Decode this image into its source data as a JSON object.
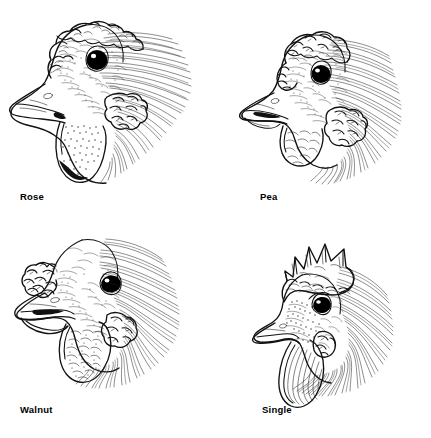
{
  "document": {
    "type": "line-art-illustration-plate",
    "subject": "Chicken comb types — head profiles",
    "background_color": "#ffffff",
    "ink_color": "#111111",
    "layout": "2x2 grid",
    "panel_count": 4
  },
  "panels": [
    {
      "id": "rose",
      "label": "Rose",
      "position": "top-left",
      "comb_type": "rose comb",
      "description": "Chicken head in left profile with a broad, bumpy rose comb rising over the crown, large round dark eye, pale beak, large pendulous wattle and textured earlobe, with hackle feathers streaming to the right.",
      "features": [
        "rose comb",
        "round eye",
        "beak",
        "wattle",
        "earlobe",
        "hackle feathers"
      ]
    },
    {
      "id": "pea",
      "label": "Pea",
      "position": "top-right",
      "comb_type": "pea comb",
      "description": "Chicken head in left profile with a low triple-ridged pea comb, round dark eye, open beak, small wattle and clustered earlobe, with long hackle feathers fanning down and right.",
      "features": [
        "pea comb",
        "round eye",
        "open beak",
        "wattle",
        "earlobe",
        "hackle feathers"
      ]
    },
    {
      "id": "walnut",
      "label": "Walnut",
      "position": "bottom-left",
      "comb_type": "walnut comb",
      "description": "Chicken head in left profile with a compact lumpy walnut comb set low over the beak, almond dark eye, long pale beak held open, heavy textured wattle, and hackle feathers sweeping right.",
      "features": [
        "walnut comb",
        "almond eye",
        "open beak",
        "wattle",
        "hackle feathers"
      ]
    },
    {
      "id": "single",
      "label": "Single",
      "position": "bottom-right",
      "comb_type": "single comb",
      "description": "Chicken head in left profile with a tall upright single comb bearing five pointed blades, dark eye, short beak, long smooth wattle, and dense hackle feathers streaming down and right.",
      "features": [
        "single comb",
        "five points",
        "eye",
        "beak",
        "wattle",
        "hackle feathers"
      ]
    }
  ],
  "labels": {
    "rose": "Rose",
    "pea": "Pea",
    "walnut": "Walnut",
    "single": "Single"
  }
}
